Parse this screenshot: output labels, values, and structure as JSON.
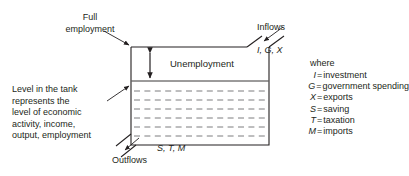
{
  "diagram": {
    "type": "economic-tank-circular-flow",
    "title_in_tank": "Unemployment",
    "annotations": {
      "full_employment": "Full\nemployment",
      "inflows_title": "Inflows",
      "inflows_vars": "I, G, X",
      "outflows_title": "Outflows",
      "outflows_vars": "S, T, M",
      "level_description": "Level in the tank\nrepresents the\nlevel of economic\nactivity, income,\noutput, employment"
    },
    "legend": {
      "heading": "where",
      "entries": [
        {
          "symbol": "I",
          "equals": "=",
          "definition": "investment"
        },
        {
          "symbol": "G",
          "equals": "=",
          "definition": "government spending"
        },
        {
          "symbol": "X",
          "equals": "=",
          "definition": "exports"
        },
        {
          "symbol": "S",
          "equals": "=",
          "definition": "saving"
        },
        {
          "symbol": "T",
          "equals": "=",
          "definition": "taxation"
        },
        {
          "symbol": "M",
          "equals": "=",
          "definition": "imports"
        }
      ]
    },
    "colors": {
      "ink": "#231f20",
      "tank_outline": "#231f20",
      "water_dash": "#58595b",
      "background": "#ffffff"
    },
    "geometry": {
      "tank_left": 131,
      "tank_right": 269,
      "tank_top": 47,
      "tank_bottom": 145,
      "water_line_y": 81,
      "dashed_line_count": 6
    }
  }
}
